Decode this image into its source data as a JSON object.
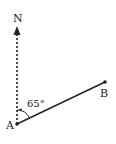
{
  "diagram": {
    "type": "bearing",
    "north_label": "N",
    "point_a_label": "A",
    "point_b_label": "B",
    "angle_label": "65°",
    "angle_degrees": 65,
    "colors": {
      "line": "#222222",
      "background": "#ffffff"
    }
  }
}
